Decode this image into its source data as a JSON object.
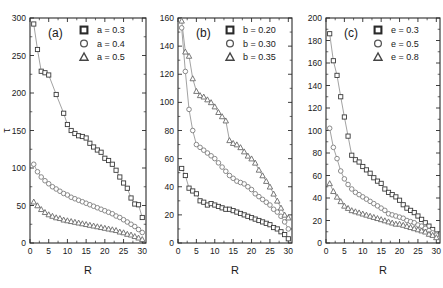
{
  "figure": {
    "xlabel": "R",
    "ylabel": "τ",
    "panel_labels": [
      "(a)",
      "(b)",
      "(c)"
    ]
  },
  "chart_data": [
    {
      "type": "scatter",
      "title": "(a)",
      "xlabel": "R",
      "ylabel": "τ",
      "xlim": [
        0,
        31
      ],
      "ylim": [
        0,
        300
      ],
      "xticks": [
        0,
        5,
        10,
        15,
        20,
        25,
        30
      ],
      "yticks": [
        0,
        50,
        100,
        150,
        200,
        250,
        300
      ],
      "grid": false,
      "legend_position": "top-right",
      "series": [
        {
          "name": "a = 0.3",
          "marker": "square",
          "x": [
            1,
            2,
            3,
            4,
            5,
            7,
            9,
            10,
            11,
            12,
            13,
            14,
            15,
            16,
            17,
            18,
            19,
            20,
            21,
            22,
            23,
            24,
            25,
            26,
            27,
            28,
            29,
            30
          ],
          "values": [
            292,
            258,
            229,
            227,
            224,
            198,
            173,
            158,
            150,
            146,
            143,
            142,
            140,
            133,
            128,
            124,
            121,
            113,
            110,
            105,
            97,
            88,
            80,
            73,
            60,
            52,
            51,
            34
          ]
        },
        {
          "name": "a = 0.4",
          "marker": "circle",
          "x": [
            1,
            2,
            3,
            4,
            5,
            6,
            7,
            8,
            9,
            10,
            11,
            12,
            13,
            14,
            15,
            16,
            17,
            18,
            19,
            20,
            21,
            22,
            23,
            24,
            25,
            26,
            27,
            28,
            29,
            30
          ],
          "values": [
            105,
            95,
            88,
            83,
            79,
            75,
            72,
            69,
            66,
            64,
            61,
            59,
            57,
            55,
            53,
            51,
            49,
            47,
            45,
            43,
            41,
            39,
            36,
            34,
            31,
            28,
            25,
            22,
            18,
            14
          ]
        },
        {
          "name": "a = 0.5",
          "marker": "triangle",
          "x": [
            1,
            2,
            3,
            4,
            5,
            6,
            7,
            8,
            9,
            10,
            11,
            12,
            13,
            14,
            15,
            16,
            17,
            18,
            19,
            20,
            21,
            22,
            23,
            24,
            25,
            26,
            27,
            28,
            29,
            30
          ],
          "values": [
            55,
            50,
            45,
            41,
            38,
            36,
            34,
            33,
            31,
            30,
            29,
            28,
            27,
            26,
            25,
            24,
            23,
            22,
            21,
            20,
            19,
            18,
            17,
            15,
            14,
            12,
            11,
            9,
            7,
            5
          ]
        }
      ]
    },
    {
      "type": "scatter",
      "title": "(b)",
      "xlabel": "R",
      "ylabel": "",
      "xlim": [
        0,
        31
      ],
      "ylim": [
        0,
        160
      ],
      "xticks": [
        0,
        5,
        10,
        15,
        20,
        25,
        30
      ],
      "yticks": [
        0,
        20,
        40,
        60,
        80,
        100,
        120,
        140,
        160
      ],
      "grid": false,
      "legend_position": "top-right",
      "series": [
        {
          "name": "b = 0.20",
          "marker": "square",
          "x": [
            1,
            2,
            3,
            4,
            5,
            6,
            7,
            8,
            9,
            10,
            11,
            12,
            13,
            14,
            15,
            16,
            17,
            18,
            19,
            20,
            21,
            22,
            23,
            24,
            25,
            26,
            27,
            28,
            29,
            30
          ],
          "values": [
            53,
            48,
            39,
            37,
            35,
            30,
            29,
            27,
            28,
            27,
            26,
            25,
            24,
            24,
            23,
            22,
            21,
            20,
            19,
            18,
            17,
            16,
            15,
            14,
            13,
            11,
            10,
            8,
            6,
            3
          ]
        },
        {
          "name": "b = 0.30",
          "marker": "circle",
          "x": [
            1,
            2,
            3,
            4,
            5,
            6,
            7,
            8,
            9,
            10,
            11,
            12,
            13,
            14,
            15,
            16,
            17,
            18,
            19,
            20,
            21,
            22,
            23,
            24,
            25,
            26,
            27,
            28,
            29,
            30
          ],
          "values": [
            153,
            122,
            95,
            80,
            70,
            68,
            66,
            64,
            62,
            60,
            57,
            54,
            51,
            48,
            46,
            44,
            43,
            42,
            40,
            38,
            35,
            33,
            31,
            29,
            27,
            24,
            22,
            19,
            15,
            10
          ]
        },
        {
          "name": "b = 0.35",
          "marker": "triangle",
          "x": [
            1,
            2,
            3,
            4,
            5,
            6,
            7,
            8,
            9,
            10,
            11,
            12,
            13,
            14,
            15,
            16,
            17,
            18,
            19,
            20,
            21,
            22,
            23,
            24,
            25,
            26,
            27,
            28,
            29,
            30
          ],
          "values": [
            158,
            136,
            133,
            117,
            108,
            105,
            104,
            102,
            100,
            97,
            93,
            90,
            87,
            73,
            71,
            70,
            68,
            65,
            62,
            60,
            57,
            52,
            48,
            44,
            40,
            35,
            30,
            25,
            20,
            18
          ]
        }
      ]
    },
    {
      "type": "scatter",
      "title": "(c)",
      "xlabel": "R",
      "ylabel": "",
      "xlim": [
        0,
        31
      ],
      "ylim": [
        0,
        200
      ],
      "xticks": [
        0,
        5,
        10,
        15,
        20,
        25,
        30
      ],
      "yticks": [
        0,
        20,
        40,
        60,
        80,
        100,
        120,
        140,
        160,
        180,
        200
      ],
      "grid": false,
      "legend_position": "top-right",
      "series": [
        {
          "name": "e = 0.3",
          "marker": "square",
          "x": [
            1,
            2,
            3,
            4,
            5,
            6,
            7,
            8,
            9,
            10,
            11,
            12,
            13,
            14,
            15,
            16,
            17,
            18,
            19,
            20,
            21,
            22,
            23,
            24,
            25,
            26,
            27,
            28,
            29,
            30
          ],
          "values": [
            186,
            162,
            149,
            130,
            112,
            95,
            78,
            74,
            72,
            68,
            65,
            62,
            58,
            55,
            53,
            48,
            45,
            43,
            41,
            38,
            34,
            31,
            29,
            27,
            24,
            21,
            18,
            15,
            12,
            8
          ]
        },
        {
          "name": "e = 0.5",
          "marker": "circle",
          "x": [
            1,
            2,
            3,
            4,
            5,
            6,
            7,
            8,
            9,
            10,
            11,
            12,
            13,
            14,
            15,
            16,
            17,
            18,
            19,
            20,
            21,
            22,
            23,
            24,
            25,
            26,
            27,
            28,
            29,
            30
          ],
          "values": [
            102,
            85,
            75,
            64,
            57,
            52,
            48,
            45,
            43,
            41,
            39,
            37,
            35,
            33,
            31,
            29,
            26,
            25,
            24,
            23,
            22,
            20,
            19,
            18,
            16,
            15,
            13,
            11,
            9,
            7
          ]
        },
        {
          "name": "e = 0.8",
          "marker": "triangle",
          "x": [
            1,
            2,
            3,
            4,
            5,
            6,
            7,
            8,
            9,
            10,
            11,
            12,
            13,
            14,
            15,
            16,
            17,
            18,
            19,
            20,
            21,
            22,
            23,
            24,
            25,
            26,
            27,
            28,
            29,
            30
          ],
          "values": [
            53,
            46,
            41,
            37,
            33,
            31,
            29,
            28,
            27,
            26,
            25,
            24,
            23,
            22,
            21,
            20,
            19,
            18,
            17,
            17,
            16,
            15,
            14,
            13,
            12,
            11,
            10,
            8,
            7,
            5
          ]
        }
      ]
    }
  ]
}
